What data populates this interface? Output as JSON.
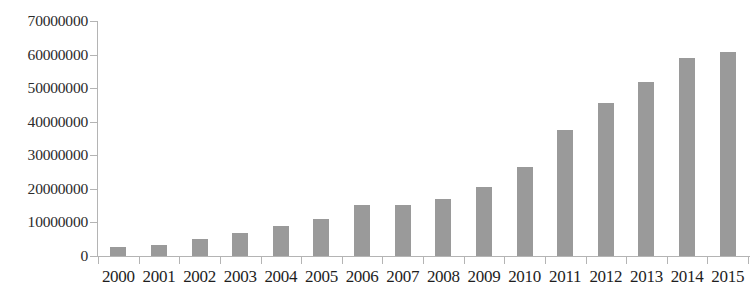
{
  "chart_data": {
    "type": "bar",
    "title": "",
    "subtitle": "",
    "xlabel": "",
    "ylabel": "",
    "categories": [
      "2000",
      "2001",
      "2002",
      "2003",
      "2004",
      "2005",
      "2006",
      "2007",
      "2008",
      "2009",
      "2010",
      "2011",
      "2012",
      "2013",
      "2014",
      "2015"
    ],
    "values": [
      2700000,
      3400000,
      5000000,
      6800000,
      8800000,
      11000000,
      15200000,
      15300000,
      17000000,
      20700000,
      26500000,
      37500000,
      45600000,
      51900000,
      59000000,
      60700000
    ],
    "ylim": [
      0,
      70000000
    ],
    "y_ticks": [
      0,
      10000000,
      20000000,
      30000000,
      40000000,
      50000000,
      60000000,
      70000000
    ],
    "y_tick_labels": [
      "0",
      "10000000",
      "20000000",
      "30000000",
      "40000000",
      "50000000",
      "60000000",
      "70000000"
    ],
    "grid": false,
    "legend": null,
    "legend_position": "none",
    "series": [
      {
        "name": "",
        "values": [
          2700000,
          3400000,
          5000000,
          6800000,
          8800000,
          11000000,
          15200000,
          15300000,
          17000000,
          20700000,
          26500000,
          37500000,
          45600000,
          51900000,
          59000000,
          60700000
        ]
      }
    ],
    "colors": {
      "bar": "#9a9a9a",
      "axis": "#b4b4b4",
      "text": "#1e1e1e",
      "background": "#ffffff"
    }
  }
}
